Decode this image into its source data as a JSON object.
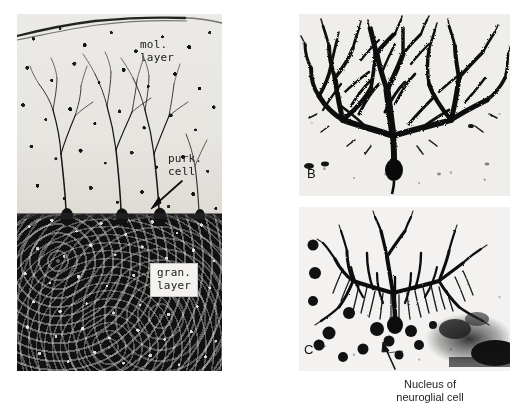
{
  "figure": {
    "kind": "histology-micrograph-plate",
    "background_color": "#ffffff",
    "width": 520,
    "height": 411
  },
  "panels": [
    {
      "id": "A",
      "name": "cerebellar-cortex-section",
      "letter": "",
      "labels": [
        {
          "id": "mol",
          "text": "mol.\nlayer",
          "style": "handwritten-overlay"
        },
        {
          "id": "purk",
          "text": "purk.\ncell",
          "style": "handwritten-overlay-with-arrow"
        },
        {
          "id": "gran",
          "text": "gran.\nlayer",
          "style": "boxed-overlay"
        }
      ],
      "tissue_zones": [
        {
          "name": "molecular-layer",
          "tone": "light"
        },
        {
          "name": "purkinje-cell-layer",
          "tone": "mixed"
        },
        {
          "name": "granular-layer",
          "tone": "dark"
        }
      ]
    },
    {
      "id": "B",
      "name": "purkinje-cell-dendritic-arbor",
      "letter": "B",
      "labels": []
    },
    {
      "id": "C",
      "name": "purkinje-cell-with-neuroglia",
      "letter": "C",
      "labels": [
        {
          "id": "arrow",
          "text": "",
          "style": "arrow-pointer"
        }
      ]
    }
  ],
  "caption": {
    "line1": "Nucleus of",
    "line2": "neuroglial cell"
  },
  "colors": {
    "ink": "#111111",
    "paper": "#ffffff",
    "panel_light": "#efeeea",
    "panel_dark": "#111111"
  }
}
